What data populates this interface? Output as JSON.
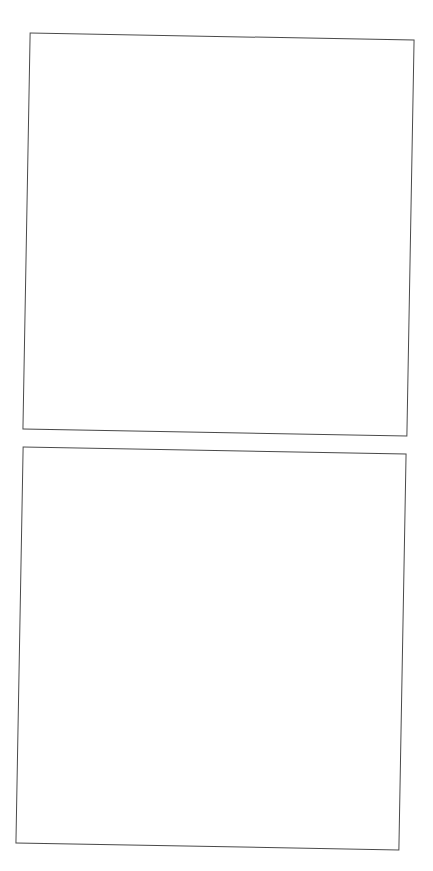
{
  "page": {
    "heading_fragment": "",
    "background_color": "#ffffff",
    "border_color": "#4a4a4a"
  },
  "frames": [
    {
      "id": "frame-1",
      "content": ""
    },
    {
      "id": "frame-2",
      "content": ""
    }
  ]
}
